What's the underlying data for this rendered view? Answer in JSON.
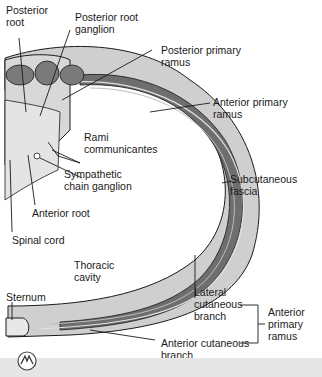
{
  "figure": {
    "labels": {
      "posterior_root": "Posterior root",
      "posterior_root_ganglion": "Posterior root ganglion",
      "posterior_primary_ramus": "Posterior primary ramus",
      "anterior_primary_ramus": "Anterior primary ramus",
      "rami_communicantes": "Rami communicantes",
      "sympathetic_chain_ganglion": "Sympathetic chain ganglion",
      "subcutaneous_fascia": "Subcutaneous fascia",
      "anterior_root": "Anterior root",
      "spinal_cord": "Spinal cord",
      "thoracic_cavity": "Thoracic cavity",
      "sternum": "Sternum",
      "lateral_cutaneous_branch": "Lateral cutaneous branch",
      "anterior_cutaneous_branch": "Anterior cutaneous branch",
      "anterior_primary_ramus_bracket": "Anterior primary ramus"
    },
    "label_lines": {
      "posterior_root": [
        "Posterior",
        "root"
      ],
      "posterior_root_ganglion": [
        "Posterior root",
        "ganglion"
      ],
      "posterior_primary_ramus": [
        "Posterior primary",
        "ramus"
      ],
      "anterior_primary_ramus": [
        "Anterior primary",
        "ramus"
      ],
      "rami_communicantes": [
        "Rami",
        "communicantes"
      ],
      "sympathetic_chain_ganglion": [
        "Sympathetic",
        "chain ganglion"
      ],
      "subcutaneous_fascia": [
        "Subcutaneous",
        "fascia"
      ],
      "anterior_root": [
        "Anterior root"
      ],
      "spinal_cord": [
        "Spinal cord"
      ],
      "thoracic_cavity": [
        "Thoracic",
        "cavity"
      ],
      "sternum": [
        "Sternum"
      ],
      "lateral_cutaneous_branch": [
        "Lateral",
        "cutaneous",
        "branch"
      ],
      "anterior_cutaneous_branch": [
        "Anterior cutaneous",
        "branch"
      ],
      "anterior_primary_ramus_bracket": [
        "Anterior",
        "primary",
        "ramus"
      ]
    },
    "colors": {
      "skin_light": "#c8c8c8",
      "muscle_dark": "#6e6e6e",
      "fascia_mid": "#a0a0a0",
      "outline": "#1a1a1a",
      "footer_bar": "#e6e6e6"
    }
  }
}
